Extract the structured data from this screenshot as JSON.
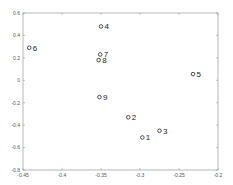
{
  "chart_data": {
    "type": "scatter",
    "title": "",
    "xlabel": "",
    "ylabel": "",
    "xlim": [
      -0.45,
      -0.2
    ],
    "ylim": [
      -0.8,
      0.6
    ],
    "grid": false,
    "legend": null,
    "x_ticks": [
      -0.45,
      -0.4,
      -0.35,
      -0.3,
      -0.25,
      -0.2
    ],
    "x_tick_labels": [
      "-0.45",
      "-0.4",
      "-0.35",
      "-0.3",
      "-0.25",
      "-0.2"
    ],
    "y_ticks": [
      0.6,
      0.4,
      0.2,
      0,
      -0.2,
      -0.4,
      -0.6,
      -0.8
    ],
    "y_tick_labels": [
      "0.6",
      "0.4",
      "0.2",
      "0",
      "-0.2",
      "-0.4",
      "-0.6",
      "-0.8"
    ],
    "marker": "circle",
    "marker_color": "#222222",
    "points": [
      {
        "label": "1",
        "x": -0.297,
        "y": -0.51
      },
      {
        "label": "2",
        "x": -0.315,
        "y": -0.33
      },
      {
        "label": "3",
        "x": -0.275,
        "y": -0.45
      },
      {
        "label": "4",
        "x": -0.35,
        "y": 0.48
      },
      {
        "label": "5",
        "x": -0.232,
        "y": 0.055
      },
      {
        "label": "6",
        "x": -0.442,
        "y": 0.29
      },
      {
        "label": "7",
        "x": -0.351,
        "y": 0.23
      },
      {
        "label": "8",
        "x": -0.353,
        "y": 0.18
      },
      {
        "label": "9",
        "x": -0.352,
        "y": -0.15
      }
    ]
  }
}
